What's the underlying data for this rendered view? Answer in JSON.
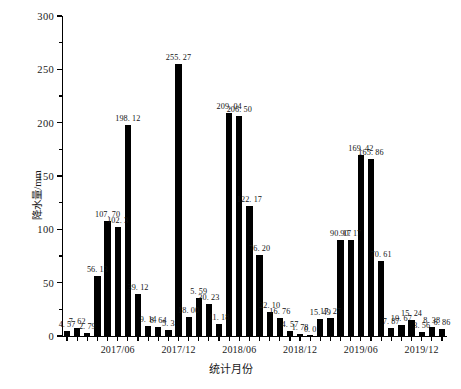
{
  "chart_data": {
    "type": "bar",
    "title": "",
    "xlabel": "统计月份",
    "ylabel": "降水量/mm",
    "ylim": [
      0,
      300
    ],
    "yticks": [
      0,
      50,
      100,
      150,
      200,
      250,
      300
    ],
    "ytick_labels": [
      "0",
      "50",
      "100",
      "150",
      "200",
      "250",
      "300"
    ],
    "yminor_ticks": [
      25,
      75,
      125,
      175,
      225,
      275
    ],
    "grid": false,
    "legend": null,
    "bar_color": "#000000",
    "categories": [
      "2017/01",
      "2017/02",
      "2017/03",
      "2017/04",
      "2017/05",
      "2017/06",
      "2017/07",
      "2017/08",
      "2017/09",
      "2017/10",
      "2017/11",
      "2017/12",
      "2018/01",
      "2018/02",
      "2018/03",
      "2018/04",
      "2018/05",
      "2018/06",
      "2018/07",
      "2018/08",
      "2018/09",
      "2018/10",
      "2018/11",
      "2018/12",
      "2019/01",
      "2019/02",
      "2019/03",
      "2019/04",
      "2019/05",
      "2019/06",
      "2019/07",
      "2019/08",
      "2019/09",
      "2019/10",
      "2019/11",
      "2019/12",
      "2020/01",
      "2020/02"
    ],
    "xtick_labels": [
      "2017/06",
      "2017/12",
      "2018/06",
      "2018/12",
      "2019/06",
      "2019/12"
    ],
    "xtick_indices": [
      5,
      11,
      17,
      23,
      29,
      35
    ],
    "values": [
      4.57,
      7.62,
      2.79,
      56.13,
      107.7,
      102.3,
      198.12,
      39.12,
      9.14,
      8.64,
      5.33,
      255.27,
      18.0,
      35.59,
      30.23,
      11.18,
      209.04,
      206.5,
      122.17,
      76.2,
      22.1,
      16.76,
      4.57,
      1.78,
      0.0,
      15.49,
      17.27,
      90.17,
      90.17,
      169.42,
      165.86,
      70.61,
      7.87,
      10.67,
      15.24,
      3.56,
      8.38,
      6.86
    ],
    "value_labels": [
      "4. 57",
      "7. 62",
      "2. 79",
      "56. 13",
      "107. 70",
      "102. 3",
      "198. 12",
      "39. 12",
      "9. 14",
      "8. 64",
      "5. 3",
      "255. 27",
      "18. 00",
      "5. 59",
      "30. 23",
      "11. 18",
      "209. 04",
      "206. 50",
      "122. 17",
      "76. 20",
      "22. 10",
      "16. 76",
      "4. 57",
      "1. 78",
      "0. 0",
      "15. 49",
      "17. 27",
      "90. 17",
      "90. 17",
      "169. 42",
      "165. 86",
      "70. 61",
      "7. 87",
      "10. 67",
      "15. 24",
      "3. 56",
      "8. 38",
      "6. 86"
    ]
  }
}
